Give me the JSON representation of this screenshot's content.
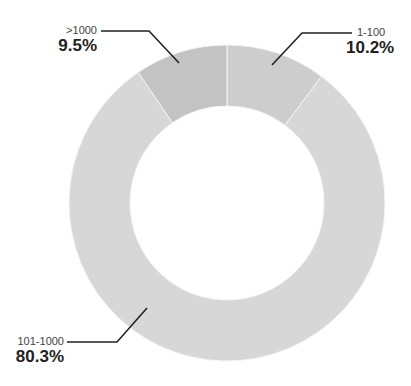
{
  "chart_data": {
    "type": "pie",
    "subtype": "donut",
    "title": "",
    "categories": [
      "1-100",
      "101-1000",
      ">1000"
    ],
    "values": [
      10.2,
      80.3,
      9.5
    ],
    "value_labels": [
      "10.2%",
      "80.3%",
      "9.5%"
    ],
    "unit": "%",
    "start_angle_deg": 0,
    "direction": "clockwise",
    "colors": [
      "#cdcdcd",
      "#d7d7d7",
      "#c3c3c3"
    ],
    "legend": "none (leader-line labels)"
  },
  "labels": {
    "slice_1_100": {
      "category": "1-100",
      "percent": "10.2%"
    },
    "slice_101_1000": {
      "category": "101-1000",
      "percent": "80.3%"
    },
    "slice_gt_1000": {
      "category": ">1000",
      "percent": "9.5%"
    }
  },
  "geometry": {
    "cx": 227,
    "cy": 203,
    "r_outer": 158,
    "r_inner": 97,
    "separator_color": "#f4f4f4",
    "leader_color": "#222222"
  }
}
